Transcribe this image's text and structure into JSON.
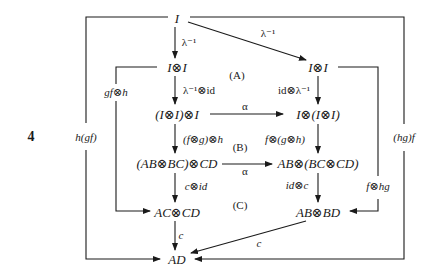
{
  "figure_number": "4",
  "nodes": {
    "top_I": "I",
    "left_IxI": "I⊗I",
    "right_IxI": "I⊗I",
    "IxI_x_I": "(I⊗I)⊗I",
    "I_x_IxI": "I⊗(I⊗I)",
    "ABxBC_x_CD": "(AB⊗BC)⊗CD",
    "AB_x_BCxCD": "AB⊗(BC⊗CD)",
    "AC_x_CD": "AC⊗CD",
    "AB_x_BD": "AB⊗BD",
    "AD": "AD"
  },
  "arrows": {
    "lambda_inv_left": "λ⁻¹",
    "lambda_inv_right": "λ⁻¹",
    "lambda_inv_x_id": "λ⁻¹⊗id",
    "id_x_lambda_inv": "id⊗λ⁻¹",
    "alpha_top": "α",
    "alpha_bottom": "α",
    "fg_h": "(f⊗g)⊗h",
    "f_gh": "f⊗(g⊗h)",
    "c_x_id": "c⊗id",
    "id_x_c": "id⊗c",
    "c_left": "c",
    "c_diag": "c",
    "gf_x_h": "gf⊗h",
    "f_x_hg": "f⊗hg",
    "h_gf": "h(gf)",
    "hg_f": "(hg)f"
  },
  "regions": {
    "A": "(A)",
    "B": "(B)",
    "C": "(C)"
  },
  "colors": {
    "ink": "#1a1a1a",
    "background": "#ffffff"
  }
}
